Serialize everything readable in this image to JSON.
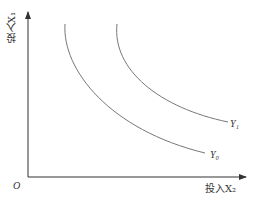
{
  "diagram": {
    "y_axis_label": "投入X₁",
    "x_axis_label": "投入X₂",
    "origin_label": "O",
    "curves": [
      {
        "name": "Y₀",
        "label": "Y₀"
      },
      {
        "name": "Y₁",
        "label": "Y₁"
      }
    ],
    "colors": {
      "axis": "#333333",
      "curve": "#777777"
    },
    "caption": ""
  }
}
